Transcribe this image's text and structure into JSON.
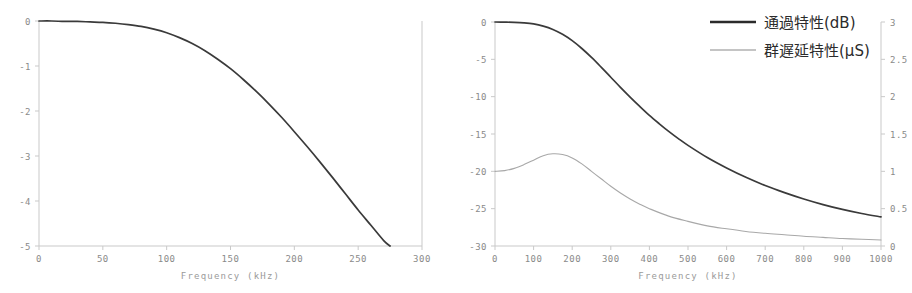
{
  "chart_data": [
    {
      "id": "left-chart",
      "type": "line",
      "title": "",
      "xlabel": "Frequency (kHz)",
      "ylabel": "",
      "xlim": [
        0,
        300
      ],
      "ylim": [
        -5,
        0
      ],
      "xticks": [
        0,
        50,
        100,
        150,
        200,
        250,
        300
      ],
      "xticklabels": [
        "0",
        "50",
        "100",
        "150",
        "200",
        "250",
        "300"
      ],
      "yticks": [
        0,
        -1,
        -2,
        -3,
        -4,
        -5
      ],
      "yticklabels": [
        "0",
        "-1",
        "-2",
        "-3",
        "-4",
        "-5"
      ],
      "grid": false,
      "legend": null,
      "series": [
        {
          "name": "gain",
          "color": "#3a3a3a",
          "x": [
            0,
            10,
            20,
            30,
            40,
            50,
            60,
            70,
            80,
            90,
            100,
            110,
            120,
            130,
            140,
            150,
            160,
            170,
            180,
            190,
            200,
            210,
            220,
            230,
            240,
            250,
            260,
            270,
            275
          ],
          "y": [
            0.0,
            0.0,
            -0.01,
            -0.01,
            -0.02,
            -0.03,
            -0.05,
            -0.08,
            -0.12,
            -0.18,
            -0.26,
            -0.37,
            -0.5,
            -0.66,
            -0.85,
            -1.06,
            -1.3,
            -1.56,
            -1.84,
            -2.14,
            -2.46,
            -2.79,
            -3.13,
            -3.48,
            -3.84,
            -4.2,
            -4.54,
            -4.88,
            -5.0
          ]
        }
      ]
    },
    {
      "id": "right-chart",
      "type": "line",
      "title": "",
      "xlabel": "Frequency (kHz)",
      "ylabel": "",
      "xlim": [
        0,
        1000
      ],
      "ylim": [
        -30,
        0
      ],
      "y2lim": [
        0,
        3
      ],
      "xticks": [
        0,
        100,
        200,
        300,
        400,
        500,
        600,
        700,
        800,
        900,
        1000
      ],
      "xticklabels": [
        "0",
        "100",
        "200",
        "300",
        "400",
        "500",
        "600",
        "700",
        "800",
        "900",
        "1000"
      ],
      "yticks": [
        0,
        -5,
        -10,
        -15,
        -20,
        -25,
        -30
      ],
      "yticklabels": [
        "0",
        "-5",
        "-10",
        "-15",
        "-20",
        "-25",
        "-30"
      ],
      "y2ticks": [
        0,
        0.5,
        1,
        1.5,
        2,
        2.5,
        3
      ],
      "y2ticklabels": [
        "0",
        "0.5",
        "1",
        "1.5",
        "2",
        "2.5",
        "3"
      ],
      "grid": false,
      "legend_position": "upper right",
      "series": [
        {
          "name": "通過特性(dB)",
          "axis": "left",
          "color": "#3a3a3a",
          "x": [
            0,
            25,
            50,
            75,
            100,
            125,
            150,
            175,
            200,
            225,
            250,
            275,
            300,
            325,
            350,
            375,
            400,
            425,
            450,
            475,
            500,
            550,
            600,
            650,
            700,
            750,
            800,
            850,
            900,
            950,
            1000
          ],
          "y": [
            0.0,
            -0.02,
            -0.05,
            -0.12,
            -0.26,
            -0.55,
            -1.0,
            -1.65,
            -2.5,
            -3.55,
            -4.75,
            -6.05,
            -7.4,
            -8.75,
            -10.05,
            -11.3,
            -12.5,
            -13.6,
            -14.65,
            -15.62,
            -16.52,
            -18.15,
            -19.55,
            -20.8,
            -21.9,
            -22.85,
            -23.7,
            -24.45,
            -25.1,
            -25.65,
            -26.1
          ]
        },
        {
          "name": "群遅延特性(μS)",
          "axis": "right",
          "color": "#a8a8a8",
          "x": [
            0,
            25,
            50,
            75,
            100,
            125,
            150,
            175,
            200,
            225,
            250,
            275,
            300,
            325,
            350,
            375,
            400,
            450,
            500,
            550,
            600,
            650,
            700,
            750,
            800,
            850,
            900,
            950,
            1000
          ],
          "y": [
            1.0,
            1.01,
            1.04,
            1.09,
            1.15,
            1.21,
            1.235,
            1.225,
            1.18,
            1.1,
            1.0,
            0.9,
            0.8,
            0.71,
            0.63,
            0.56,
            0.5,
            0.4,
            0.33,
            0.27,
            0.23,
            0.195,
            0.17,
            0.15,
            0.13,
            0.115,
            0.1,
            0.09,
            0.08
          ]
        }
      ]
    }
  ],
  "legend": {
    "items": [
      {
        "label": "通過特性(dB)",
        "style": "main"
      },
      {
        "label": "群遅延特性(μS)",
        "style": "alt"
      }
    ]
  },
  "colors": {
    "series_main": "#3a3a3a",
    "series_alt": "#a8a8a8",
    "axis": "#c9c9c9",
    "tick_text": "#8a8a8a",
    "background": "#ffffff"
  }
}
